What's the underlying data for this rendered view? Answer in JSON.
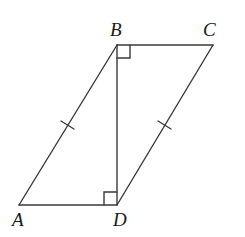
{
  "figure": {
    "type": "parallelogram",
    "stroke_color": "#3a3a3a",
    "background": "#ffffff",
    "vertices": {
      "A": {
        "label": "A",
        "x": 19,
        "y": 205,
        "label_x": 12,
        "label_y": 226
      },
      "B": {
        "label": "B",
        "x": 117,
        "y": 45,
        "label_x": 110,
        "label_y": 36
      },
      "C": {
        "label": "C",
        "x": 213,
        "y": 45,
        "label_x": 203,
        "label_y": 36
      },
      "D": {
        "label": "D",
        "x": 117,
        "y": 205,
        "label_x": 113,
        "label_y": 226
      }
    },
    "segments": [
      "AB",
      "BC",
      "CD",
      "DA",
      "BD"
    ],
    "right_angles": [
      "DBC",
      "ADB"
    ],
    "equal_marks": [
      "AB",
      "CD"
    ]
  }
}
